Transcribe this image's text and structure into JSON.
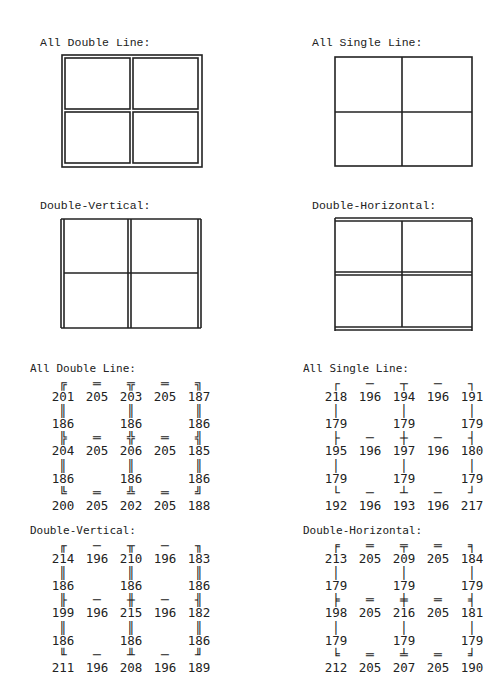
{
  "diagrams": {
    "all_double": {
      "label": "All Double Line:"
    },
    "all_single": {
      "label": "All Single Line:"
    },
    "double_vertical": {
      "label": "Double-Vertical:"
    },
    "double_horizontal": {
      "label": "Double-Horizontal:"
    }
  },
  "tables": {
    "all_double": {
      "label": "All Double Line:",
      "rows": [
        [
          {
            "g": "╔",
            "c": "201"
          },
          {
            "g": "═",
            "c": "205"
          },
          {
            "g": "╦",
            "c": "203"
          },
          {
            "g": "═",
            "c": "205"
          },
          {
            "g": "╗",
            "c": "187"
          }
        ],
        [
          {
            "g": "║",
            "c": "186"
          },
          {
            "g": "",
            "c": ""
          },
          {
            "g": "║",
            "c": "186"
          },
          {
            "g": "",
            "c": ""
          },
          {
            "g": "║",
            "c": "186"
          }
        ],
        [
          {
            "g": "╠",
            "c": "204"
          },
          {
            "g": "═",
            "c": "205"
          },
          {
            "g": "╬",
            "c": "206"
          },
          {
            "g": "═",
            "c": "205"
          },
          {
            "g": "╣",
            "c": "185"
          }
        ],
        [
          {
            "g": "║",
            "c": "186"
          },
          {
            "g": "",
            "c": ""
          },
          {
            "g": "║",
            "c": "186"
          },
          {
            "g": "",
            "c": ""
          },
          {
            "g": "║",
            "c": "186"
          }
        ],
        [
          {
            "g": "╚",
            "c": "200"
          },
          {
            "g": "═",
            "c": "205"
          },
          {
            "g": "╩",
            "c": "202"
          },
          {
            "g": "═",
            "c": "205"
          },
          {
            "g": "╝",
            "c": "188"
          }
        ]
      ]
    },
    "all_single": {
      "label": "All Single Line:",
      "rows": [
        [
          {
            "g": "┌",
            "c": "218"
          },
          {
            "g": "─",
            "c": "196"
          },
          {
            "g": "┬",
            "c": "194"
          },
          {
            "g": "─",
            "c": "196"
          },
          {
            "g": "┐",
            "c": "191"
          }
        ],
        [
          {
            "g": "│",
            "c": "179"
          },
          {
            "g": "",
            "c": ""
          },
          {
            "g": "│",
            "c": "179"
          },
          {
            "g": "",
            "c": ""
          },
          {
            "g": "│",
            "c": "179"
          }
        ],
        [
          {
            "g": "├",
            "c": "195"
          },
          {
            "g": "─",
            "c": "196"
          },
          {
            "g": "┼",
            "c": "197"
          },
          {
            "g": "─",
            "c": "196"
          },
          {
            "g": "┤",
            "c": "180"
          }
        ],
        [
          {
            "g": "│",
            "c": "179"
          },
          {
            "g": "",
            "c": ""
          },
          {
            "g": "│",
            "c": "179"
          },
          {
            "g": "",
            "c": ""
          },
          {
            "g": "│",
            "c": "179"
          }
        ],
        [
          {
            "g": "└",
            "c": "192"
          },
          {
            "g": "─",
            "c": "196"
          },
          {
            "g": "┴",
            "c": "193"
          },
          {
            "g": "─",
            "c": "196"
          },
          {
            "g": "┘",
            "c": "217"
          }
        ]
      ]
    },
    "double_vertical": {
      "label": "Double-Vertical:",
      "rows": [
        [
          {
            "g": "╓",
            "c": "214"
          },
          {
            "g": "─",
            "c": "196"
          },
          {
            "g": "╥",
            "c": "210"
          },
          {
            "g": "─",
            "c": "196"
          },
          {
            "g": "╖",
            "c": "183"
          }
        ],
        [
          {
            "g": "║",
            "c": "186"
          },
          {
            "g": "",
            "c": ""
          },
          {
            "g": "║",
            "c": "186"
          },
          {
            "g": "",
            "c": ""
          },
          {
            "g": "║",
            "c": "186"
          }
        ],
        [
          {
            "g": "╟",
            "c": "199"
          },
          {
            "g": "─",
            "c": "196"
          },
          {
            "g": "╫",
            "c": "215"
          },
          {
            "g": "─",
            "c": "196"
          },
          {
            "g": "╢",
            "c": "182"
          }
        ],
        [
          {
            "g": "║",
            "c": "186"
          },
          {
            "g": "",
            "c": ""
          },
          {
            "g": "║",
            "c": "186"
          },
          {
            "g": "",
            "c": ""
          },
          {
            "g": "║",
            "c": "186"
          }
        ],
        [
          {
            "g": "╙",
            "c": "211"
          },
          {
            "g": "─",
            "c": "196"
          },
          {
            "g": "╨",
            "c": "208"
          },
          {
            "g": "─",
            "c": "196"
          },
          {
            "g": "╜",
            "c": "189"
          }
        ]
      ]
    },
    "double_horizontal": {
      "label": "Double-Horizontal:",
      "rows": [
        [
          {
            "g": "╒",
            "c": "213"
          },
          {
            "g": "═",
            "c": "205"
          },
          {
            "g": "╤",
            "c": "209"
          },
          {
            "g": "═",
            "c": "205"
          },
          {
            "g": "╕",
            "c": "184"
          }
        ],
        [
          {
            "g": "│",
            "c": "179"
          },
          {
            "g": "",
            "c": ""
          },
          {
            "g": "│",
            "c": "179"
          },
          {
            "g": "",
            "c": ""
          },
          {
            "g": "│",
            "c": "179"
          }
        ],
        [
          {
            "g": "╞",
            "c": "198"
          },
          {
            "g": "═",
            "c": "205"
          },
          {
            "g": "╪",
            "c": "216"
          },
          {
            "g": "═",
            "c": "205"
          },
          {
            "g": "╡",
            "c": "181"
          }
        ],
        [
          {
            "g": "│",
            "c": "179"
          },
          {
            "g": "",
            "c": ""
          },
          {
            "g": "│",
            "c": "179"
          },
          {
            "g": "",
            "c": ""
          },
          {
            "g": "│",
            "c": "179"
          }
        ],
        [
          {
            "g": "╘",
            "c": "212"
          },
          {
            "g": "═",
            "c": "205"
          },
          {
            "g": "╧",
            "c": "207"
          },
          {
            "g": "═",
            "c": "205"
          },
          {
            "g": "╛",
            "c": "190"
          }
        ]
      ]
    }
  }
}
